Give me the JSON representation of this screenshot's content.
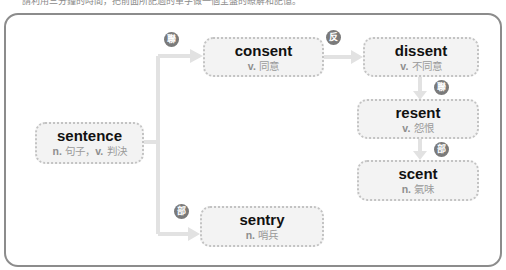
{
  "instruction": "請利用三分鐘的時間，把前面所記過的單字做一個全盤的瞭解和記憶。",
  "colors": {
    "frame": "#8c8c8c",
    "node_bg": "#f3f3f3",
    "node_border": "#c3c3c3",
    "connector": "#e2e2e2",
    "badge": "#7a7a7a"
  },
  "nodes": {
    "sentence": {
      "word": "sentence",
      "pos1": "n.",
      "def1": "句子",
      "sep": "，",
      "pos2": "v.",
      "def2": "判決"
    },
    "consent": {
      "word": "consent",
      "pos": "v.",
      "def": "同意"
    },
    "dissent": {
      "word": "dissent",
      "pos": "v.",
      "def": "不同意"
    },
    "resent": {
      "word": "resent",
      "pos": "v.",
      "def": "怨恨"
    },
    "scent": {
      "word": "scent",
      "pos": "n.",
      "def": "氣味"
    },
    "sentry": {
      "word": "sentry",
      "pos": "n.",
      "def": "哨兵"
    }
  },
  "badges": {
    "to_consent": "聯",
    "consent_to_dissent": "反",
    "dissent_to_resent": "聯",
    "resent_to_scent": "部",
    "to_sentry": "部"
  }
}
